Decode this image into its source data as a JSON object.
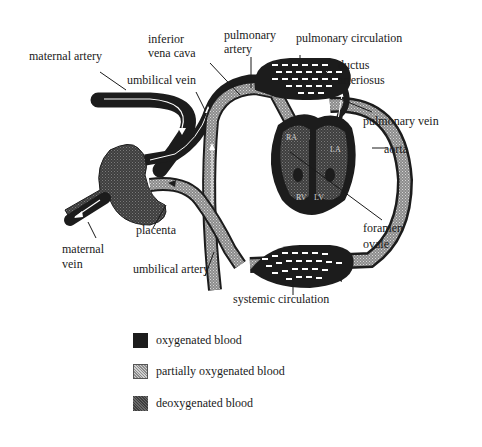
{
  "colors": {
    "oxygenated": "#1c1c1c",
    "partially_oxygenated": "#9a9a9a",
    "deoxygenated": "#4a4a4a",
    "line": "#1a1a1a",
    "arrow": "#ffffff"
  },
  "labels": {
    "maternal_artery": "maternal artery",
    "inferior_vena_cava_1": "inferior",
    "inferior_vena_cava_2": "vena cava",
    "pulmonary_artery_1": "pulmonary",
    "pulmonary_artery_2": "artery",
    "pulmonary_circulation": "pulmonary circulation",
    "ductus_arteriosus_1": "ductus",
    "ductus_arteriosus_2": "arteriosus",
    "umbilical_vein": "umbilical vein",
    "pulmonary_vein": "pulmonary vein",
    "aorta": "aorta",
    "foramen_ovale_1": "foramen",
    "foramen_ovale_2": "ovale",
    "placenta": "placenta",
    "maternal_vein_1": "maternal",
    "maternal_vein_2": "vein",
    "umbilical_artery": "umbilical artery",
    "systemic_circulation": "systemic circulation",
    "heart_chambers": {
      "ra": "RA",
      "la": "LA",
      "rv": "RV",
      "lv": "LV"
    }
  },
  "legend": {
    "items": [
      {
        "label": "oxygenated blood",
        "key": "oxygenated"
      },
      {
        "label": "partially oxygenated blood",
        "key": "partially_oxygenated"
      },
      {
        "label": "deoxygenated blood",
        "key": "deoxygenated"
      }
    ]
  }
}
